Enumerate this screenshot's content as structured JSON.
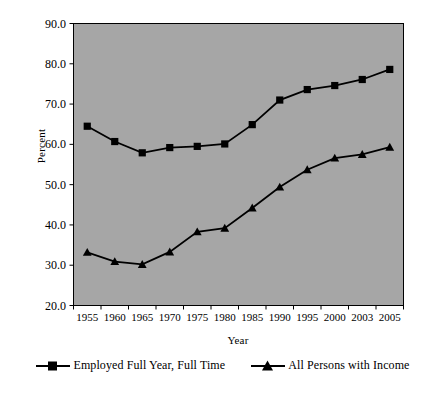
{
  "chart_data": {
    "type": "line",
    "title": "",
    "subtitle": "",
    "xlabel": "Year",
    "ylabel": "Percent",
    "categories": [
      "1955",
      "1960",
      "1965",
      "1970",
      "1975",
      "1980",
      "1985",
      "1990",
      "1995",
      "2000",
      "2003",
      "2005"
    ],
    "x": [
      1955,
      1960,
      1965,
      1970,
      1975,
      1980,
      1985,
      1990,
      1995,
      2000,
      2003,
      2005
    ],
    "series": [
      {
        "name": "Employed Full Year, Full Time",
        "marker": "square",
        "values": [
          64.5,
          60.7,
          57.9,
          59.2,
          59.5,
          60.1,
          64.9,
          71.0,
          73.6,
          74.6,
          76.1,
          78.6
        ]
      },
      {
        "name": "All Persons with Income",
        "marker": "triangle",
        "values": [
          33.2,
          30.9,
          30.2,
          33.3,
          38.3,
          39.2,
          44.2,
          49.4,
          53.7,
          56.6,
          57.5,
          59.3
        ]
      }
    ],
    "ylim": [
      20.0,
      90.0
    ],
    "ytick_labels": [
      "90.0",
      "80.0",
      "70.0",
      "60.0",
      "50.0",
      "40.0",
      "30.0",
      "20.0"
    ],
    "ytick_values": [
      90.0,
      80.0,
      70.0,
      60.0,
      50.0,
      40.0,
      30.0,
      20.0
    ],
    "grid": false,
    "legend_position": "bottom",
    "plot_background_color": "#a6a6a6",
    "line_color": "#000000",
    "page_background_color": "#ffffff"
  },
  "legend": {
    "entries": [
      {
        "label": "Employed Full Year, Full Time"
      },
      {
        "label": "All Persons with Income"
      }
    ]
  }
}
